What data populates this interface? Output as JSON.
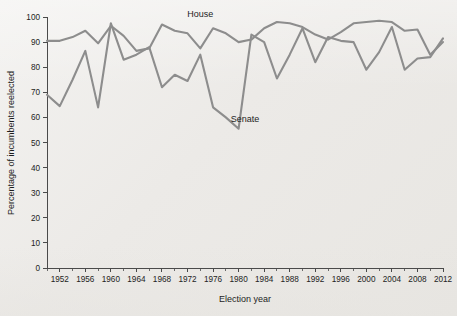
{
  "chart_data": {
    "type": "line",
    "title": "",
    "xlabel": "Election year",
    "ylabel": "Percentage of incumbents reelected",
    "xlim": [
      1950,
      2012
    ],
    "ylim": [
      0,
      100
    ],
    "x_tick_labels": [
      "1952",
      "1956",
      "1960",
      "1964",
      "1968",
      "1972",
      "1976",
      "1980",
      "1984",
      "1988",
      "1992",
      "1996",
      "2000",
      "2004",
      "2008",
      "2012"
    ],
    "x_major_ticks": [
      1952,
      1956,
      1960,
      1964,
      1968,
      1972,
      1976,
      1980,
      1984,
      1988,
      1992,
      1996,
      2000,
      2004,
      2008,
      2012
    ],
    "x_minor_ticks": [
      1950,
      1954,
      1958,
      1962,
      1966,
      1970,
      1974,
      1978,
      1982,
      1986,
      1990,
      1994,
      1998,
      2002,
      2006,
      2010
    ],
    "y_tick_labels": [
      "0",
      "10",
      "20",
      "30",
      "40",
      "50",
      "60",
      "70",
      "80",
      "90",
      "100"
    ],
    "y_ticks": [
      0,
      10,
      20,
      30,
      40,
      50,
      60,
      70,
      80,
      90,
      100
    ],
    "grid": false,
    "legend_position": "inline-annotations",
    "x": [
      1950,
      1952,
      1954,
      1956,
      1958,
      1960,
      1962,
      1964,
      1966,
      1968,
      1970,
      1972,
      1974,
      1976,
      1978,
      1980,
      1982,
      1984,
      1986,
      1988,
      1990,
      1992,
      1994,
      1996,
      1998,
      2000,
      2002,
      2004,
      2006,
      2008,
      2010,
      2012
    ],
    "series": [
      {
        "name": "House",
        "color": "#8d8d8d",
        "label": "House",
        "label_x": 1974,
        "label_y": 100,
        "values": [
          90.5,
          90.5,
          92.0,
          94.5,
          89.5,
          96.5,
          92.5,
          86.5,
          87.5,
          97.0,
          94.5,
          93.5,
          87.5,
          95.5,
          93.5,
          90.0,
          91.0,
          95.5,
          98.0,
          97.5,
          96.0,
          93.0,
          91.0,
          94.0,
          97.5,
          98.0,
          98.5,
          98.0,
          94.5,
          95.0,
          85.0,
          90.0
        ]
      },
      {
        "name": "Senate",
        "color": "#8d8d8d",
        "label": "Senate",
        "label_x": 1981,
        "label_y": 58,
        "values": [
          69.0,
          64.5,
          75.0,
          86.5,
          64.0,
          97.5,
          83.0,
          85.0,
          88.0,
          72.0,
          77.0,
          74.5,
          85.0,
          64.0,
          60.0,
          55.5,
          93.0,
          90.0,
          75.5,
          85.0,
          95.5,
          82.0,
          92.0,
          90.5,
          90.0,
          79.0,
          86.0,
          96.0,
          79.0,
          83.5,
          84.0,
          91.5
        ]
      }
    ]
  }
}
